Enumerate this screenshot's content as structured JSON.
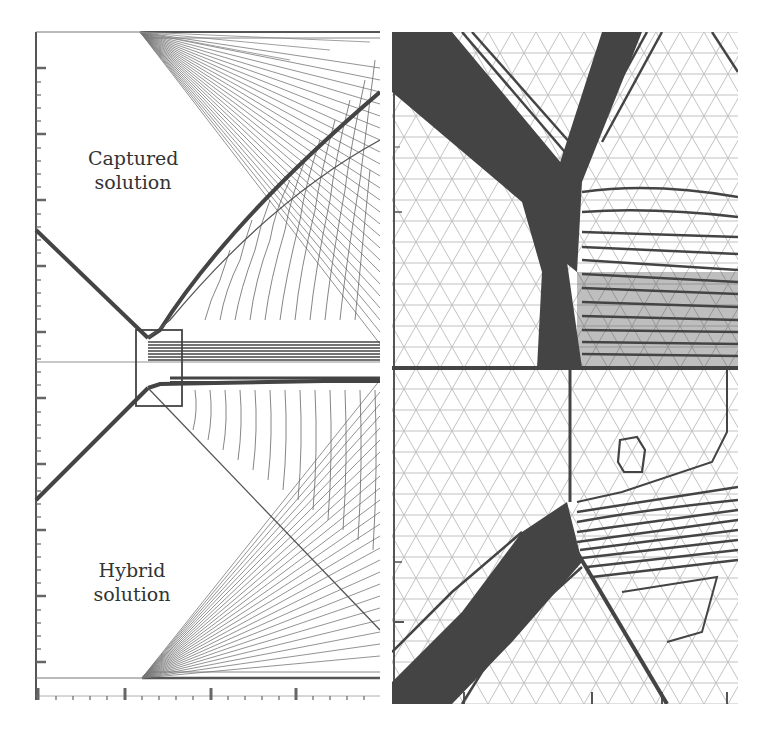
{
  "figure": {
    "left_panel": {
      "labels": {
        "captured": "Captured solution",
        "captured_line1": "Captured",
        "captured_line2": "solution",
        "hybrid_line1": "Hybrid",
        "hybrid_line2": "solution"
      },
      "description": "Shock reflection contour plot; upper half captured solution, lower half hybrid solution; zoom box near centerline"
    },
    "right_panel": {
      "description": "Zoomed view of boxed region showing triangular mesh with contour lines; upper half captured, lower half hybrid"
    },
    "colors": {
      "contour": "#555555",
      "shock": "#444444",
      "mesh": "#bbbbbb",
      "axis": "#555555",
      "background": "#ffffff"
    }
  }
}
